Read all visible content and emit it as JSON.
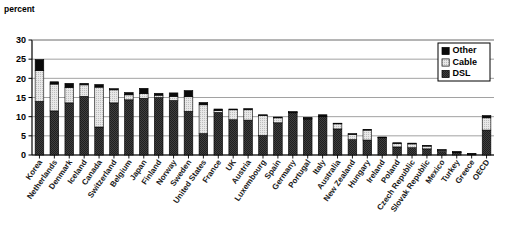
{
  "chart_data": {
    "type": "bar",
    "stacked": true,
    "title": "",
    "subtitle": "",
    "xlabel": "",
    "ylabel": "percent",
    "ylim": [
      0,
      30
    ],
    "ytick_values": [
      0,
      5,
      10,
      15,
      20,
      25,
      30
    ],
    "ytick_labels": [
      "0",
      "5",
      "10",
      "15",
      "20",
      "25",
      "30"
    ],
    "grid": true,
    "grid_axis": "y",
    "legend_position": "top-right",
    "legend_entries": [
      "Other",
      "Cable",
      "DSL"
    ],
    "categories": [
      "Korea",
      "Netherlands",
      "Denmark",
      "Iceland",
      "Canada",
      "Switzerland",
      "Belgium",
      "Japan",
      "Finland",
      "Norway",
      "Sweden",
      "United States",
      "France",
      "UK",
      "Austria",
      "Luxembourg",
      "Spain",
      "Germany",
      "Portugal",
      "Italy",
      "Australia",
      "New Zealand",
      "Hungary",
      "Ireland",
      "Poland",
      "Czech Republic",
      "Slovak Republic",
      "Mexico",
      "Turkey",
      "Greece",
      "OECD"
    ],
    "series": [
      {
        "name": "DSL",
        "color": "#3a3a3a",
        "values": [
          14.0,
          11.5,
          13.6,
          15.3,
          7.3,
          13.6,
          14.4,
          14.8,
          15.0,
          14.2,
          11.4,
          5.6,
          11.1,
          9.2,
          9.1,
          5.1,
          8.4,
          11.1,
          9.4,
          10.0,
          6.8,
          4.0,
          3.9,
          4.6,
          2.1,
          1.9,
          1.6,
          0.9,
          0.7,
          0.3,
          6.5
        ]
      },
      {
        "name": "Cable",
        "color": "#dcdcdc",
        "values": [
          8.0,
          7.0,
          4.0,
          3.0,
          10.4,
          3.4,
          1.3,
          1.2,
          0.6,
          1.1,
          3.8,
          7.5,
          0.5,
          2.6,
          2.7,
          5.2,
          1.3,
          0.1,
          0.2,
          0.0,
          1.4,
          1.4,
          2.6,
          0.0,
          0.9,
          1.0,
          0.8,
          0.4,
          0.1,
          0.0,
          3.2
        ]
      },
      {
        "name": "Other",
        "color": "#000000",
        "values": [
          2.9,
          0.6,
          1.1,
          0.4,
          0.7,
          0.3,
          0.6,
          1.4,
          0.5,
          0.9,
          1.6,
          0.6,
          0.4,
          0.2,
          0.3,
          0.2,
          0.2,
          0.1,
          0.2,
          0.5,
          0.1,
          0.2,
          0.2,
          0.1,
          0.2,
          0.2,
          0.1,
          0.1,
          0.1,
          0.1,
          0.6
        ]
      }
    ]
  }
}
